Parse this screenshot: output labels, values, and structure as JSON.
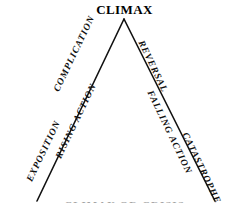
{
  "diagram": {
    "title": "CLIMAX",
    "type": "freytag-pyramid",
    "stroke_color": "#111111",
    "background_color": "#ffffff",
    "apex": {
      "x": 124,
      "y": 19
    },
    "left_base": {
      "x": 37,
      "y": 201
    },
    "right_base": {
      "x": 215,
      "y": 201
    },
    "rising_labels": [
      {
        "id": "complication",
        "text": "COMPLICATION"
      },
      {
        "id": "rising-action",
        "text": "RISING ACTION"
      },
      {
        "id": "exposition",
        "text": "EXPOSITION"
      }
    ],
    "falling_labels": [
      {
        "id": "reversal",
        "text": "REVERSAL"
      },
      {
        "id": "falling-action",
        "text": "FALLING ACTION"
      },
      {
        "id": "catastrophe",
        "text": "CATASTROPHE"
      }
    ],
    "edge_remnant": "CLIMAX OR CRISIS"
  }
}
